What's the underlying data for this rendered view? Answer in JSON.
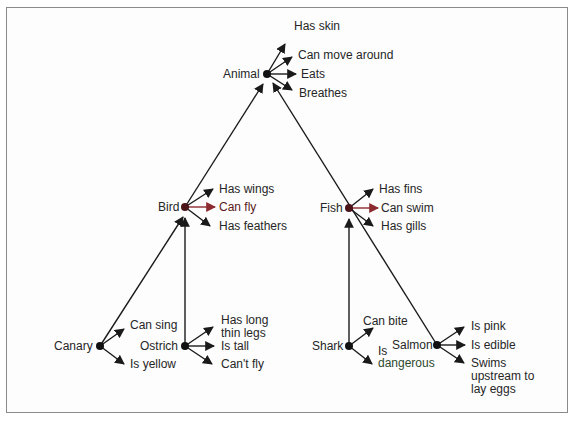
{
  "colors": {
    "line": "#1a1a1a",
    "node": "#111111",
    "node_accent": "#4a1418",
    "accent_arrow": "#8b2a2f",
    "accent_text": "#5a1a20",
    "text": "#262626",
    "green_text": "#2e4a2e"
  },
  "nodes": {
    "animal": {
      "label": "Animal",
      "properties": [
        "Has skin",
        "Can move around",
        "Eats",
        "Breathes"
      ]
    },
    "bird": {
      "label": "Bird",
      "properties": [
        "Has wings",
        "Can fly",
        "Has feathers"
      ]
    },
    "fish": {
      "label": "Fish",
      "properties": [
        "Has fins",
        "Can swim",
        "Has gills"
      ]
    },
    "canary": {
      "label": "Canary",
      "properties": [
        "Can sing",
        "Is yellow"
      ]
    },
    "ostrich": {
      "label": "Ostrich",
      "properties": [
        "Has long thin legs",
        "Is tall",
        "Can't fly"
      ]
    },
    "shark": {
      "label": "Shark",
      "properties": [
        "Can bite",
        "Is",
        "dangerous"
      ]
    },
    "salmon": {
      "label": "Salmon",
      "properties": [
        "Is pink",
        "Is edible",
        "Swims upstream to lay eggs"
      ]
    }
  }
}
